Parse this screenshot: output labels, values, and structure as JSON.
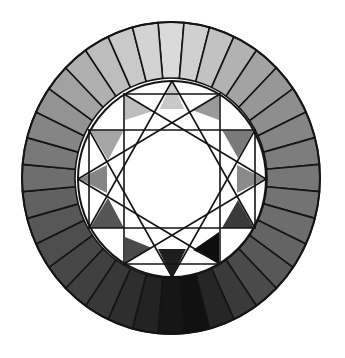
{
  "figure": {
    "kind": "grayscale color wheel with twelve-pointed star",
    "background": "#ffffff",
    "line_color": "#141414"
  },
  "outer_ring": {
    "center": [
      171,
      178
    ],
    "outer_radius": [
      149,
      156
    ],
    "inner_radius": [
      94,
      98
    ],
    "segment_count": 36,
    "start_angle_deg": -5,
    "segment_colors": [
      "#dadada",
      "#d0d0d0",
      "#c2c2c2",
      "#b2b2b2",
      "#a3a3a3",
      "#979797",
      "#8e8e8e",
      "#858585",
      "#7d7d7d",
      "#777777",
      "#737373",
      "#6d6d6d",
      "#646464",
      "#585858",
      "#4a4a4a",
      "#3a3a3a",
      "#262626",
      "#111111",
      "#161616",
      "#232323",
      "#2e2e2e",
      "#383838",
      "#404040",
      "#474747",
      "#4e4e4e",
      "#575757",
      "#616161",
      "#6e6e6e",
      "#797979",
      "#858585",
      "#939393",
      "#a2a2a2",
      "#b0b0b0",
      "#bdbdbd",
      "#c9c9c9",
      "#d3d3d3"
    ]
  },
  "inner_disc": {
    "center": [
      172,
      179
    ],
    "radius": [
      94,
      98
    ],
    "fill": "#ffffff"
  },
  "star": {
    "points": [
      {
        "angle": 0,
        "xy": [
          172,
          81
        ]
      },
      {
        "angle": 30,
        "xy": [
          220,
          94
        ]
      },
      {
        "angle": 60,
        "xy": [
          255,
          130
        ]
      },
      {
        "angle": 90,
        "xy": [
          266,
          179
        ]
      },
      {
        "angle": 120,
        "xy": [
          255,
          228
        ]
      },
      {
        "angle": 150,
        "xy": [
          220,
          264
        ]
      },
      {
        "angle": 180,
        "xy": [
          172,
          277
        ]
      },
      {
        "angle": 210,
        "xy": [
          124,
          264
        ]
      },
      {
        "angle": 240,
        "xy": [
          89,
          228
        ]
      },
      {
        "angle": 270,
        "xy": [
          78,
          179
        ]
      },
      {
        "angle": 300,
        "xy": [
          89,
          130
        ]
      },
      {
        "angle": 330,
        "xy": [
          124,
          94
        ]
      }
    ],
    "lines": [
      [
        0,
        4
      ],
      [
        4,
        8
      ],
      [
        8,
        0
      ],
      [
        2,
        6
      ],
      [
        6,
        10
      ],
      [
        10,
        2
      ],
      [
        1,
        5
      ],
      [
        5,
        9
      ],
      [
        9,
        1
      ],
      [
        3,
        7
      ],
      [
        7,
        11
      ],
      [
        11,
        3
      ],
      [
        11,
        1
      ],
      [
        1,
        5
      ],
      [
        5,
        7
      ],
      [
        7,
        11
      ],
      [
        10,
        2
      ],
      [
        2,
        4
      ],
      [
        4,
        8
      ],
      [
        8,
        10
      ]
    ],
    "tip_triangles": [
      {
        "angle": 0,
        "fill": "#c8c8c8",
        "pts": [
          [
            172,
            81
          ],
          [
            160,
            109
          ],
          [
            184,
            109
          ]
        ]
      },
      {
        "angle": 30,
        "fill": "#9a9a9a",
        "pts": [
          [
            219,
            94
          ],
          [
            219,
            120
          ],
          [
            192,
            110
          ]
        ]
      },
      {
        "angle": 60,
        "fill": "#7a7a7a",
        "pts": [
          [
            254,
            130
          ],
          [
            222,
            130
          ],
          [
            238,
            158
          ]
        ]
      },
      {
        "angle": 90,
        "fill": "#8a8a8a",
        "pts": [
          [
            265,
            179
          ],
          [
            237,
            165
          ],
          [
            237,
            193
          ]
        ]
      },
      {
        "angle": 120,
        "fill": "#3a3a3a",
        "pts": [
          [
            254,
            228
          ],
          [
            222,
            228
          ],
          [
            238,
            200
          ]
        ]
      },
      {
        "angle": 150,
        "fill": "#0e0e0e",
        "pts": [
          [
            219,
            263
          ],
          [
            219,
            232
          ],
          [
            193,
            250
          ]
        ]
      },
      {
        "angle": 180,
        "fill": "#1e1e1e",
        "pts": [
          [
            172,
            277
          ],
          [
            158,
            249
          ],
          [
            186,
            249
          ]
        ]
      },
      {
        "angle": 210,
        "fill": "#4a4a4a",
        "pts": [
          [
            125,
            263
          ],
          [
            125,
            237
          ],
          [
            152,
            248
          ]
        ]
      },
      {
        "angle": 240,
        "fill": "#555555",
        "pts": [
          [
            90,
            228
          ],
          [
            124,
            228
          ],
          [
            108,
            198
          ]
        ]
      },
      {
        "angle": 270,
        "fill": "#858585",
        "pts": [
          [
            79,
            179
          ],
          [
            107,
            165
          ],
          [
            107,
            193
          ]
        ]
      },
      {
        "angle": 300,
        "fill": "#a5a5a5",
        "pts": [
          [
            90,
            130
          ],
          [
            124,
            130
          ],
          [
            108,
            160
          ]
        ]
      },
      {
        "angle": 330,
        "fill": "#bdbdbd",
        "pts": [
          [
            125,
            94
          ],
          [
            125,
            120
          ],
          [
            153,
            111
          ]
        ]
      }
    ]
  },
  "accessibility": {
    "label": "Grayscale color wheel"
  }
}
